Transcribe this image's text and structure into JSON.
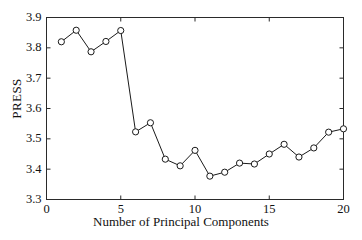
{
  "chart_data": {
    "type": "line",
    "title": "",
    "xlabel": "Number of Principal Components",
    "ylabel": "PRESS",
    "xlim": [
      0,
      20
    ],
    "ylim": [
      3.3,
      3.9
    ],
    "xticks": [
      0,
      5,
      10,
      15,
      20
    ],
    "xtick_labels": [
      "0",
      "5",
      "10",
      "15",
      "20"
    ],
    "yticks": [
      3.3,
      3.4,
      3.5,
      3.6,
      3.7,
      3.8,
      3.9
    ],
    "ytick_labels": [
      "3.3",
      "3.4",
      "3.5",
      "3.6",
      "3.7",
      "3.8",
      "3.9"
    ],
    "grid": false,
    "legend": null,
    "marker": "circle-open",
    "line_color": "#1a1a1a",
    "marker_color": "#1a1a1a",
    "x": [
      1,
      2,
      3,
      4,
      5,
      6,
      7,
      8,
      9,
      10,
      11,
      12,
      13,
      14,
      15,
      16,
      17,
      18,
      19,
      20
    ],
    "values": [
      3.82,
      3.858,
      3.787,
      3.821,
      3.857,
      3.523,
      3.553,
      3.433,
      3.411,
      3.462,
      3.377,
      3.39,
      3.42,
      3.417,
      3.45,
      3.482,
      3.44,
      3.47,
      3.522,
      3.533
    ],
    "series": [
      {
        "name": "PRESS",
        "values": [
          3.82,
          3.858,
          3.787,
          3.821,
          3.857,
          3.523,
          3.553,
          3.433,
          3.411,
          3.462,
          3.377,
          3.39,
          3.42,
          3.417,
          3.45,
          3.482,
          3.44,
          3.47,
          3.522,
          3.533
        ]
      }
    ]
  }
}
